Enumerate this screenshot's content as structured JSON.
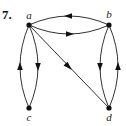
{
  "problem": {
    "number": "7."
  },
  "graph": {
    "type": "directed",
    "vertices": [
      {
        "id": "a",
        "label": "a",
        "x": 29,
        "y": 25
      },
      {
        "id": "b",
        "label": "b",
        "x": 109,
        "y": 25
      },
      {
        "id": "c",
        "label": "c",
        "x": 29,
        "y": 108
      },
      {
        "id": "d",
        "label": "d",
        "x": 109,
        "y": 108
      }
    ],
    "edges": [
      {
        "from": "b",
        "to": "a",
        "shape": "arc-top"
      },
      {
        "from": "a",
        "to": "b",
        "shape": "arc-bottom"
      },
      {
        "from": "c",
        "to": "a",
        "shape": "arc-left"
      },
      {
        "from": "a",
        "to": "c",
        "shape": "arc-right"
      },
      {
        "from": "b",
        "to": "d",
        "shape": "arc-left"
      },
      {
        "from": "d",
        "to": "b",
        "shape": "arc-right"
      },
      {
        "from": "a",
        "to": "d",
        "shape": "straight"
      }
    ]
  },
  "colors": {
    "edge": "#333333",
    "vertex": "#111111",
    "background": "#ffffff"
  }
}
